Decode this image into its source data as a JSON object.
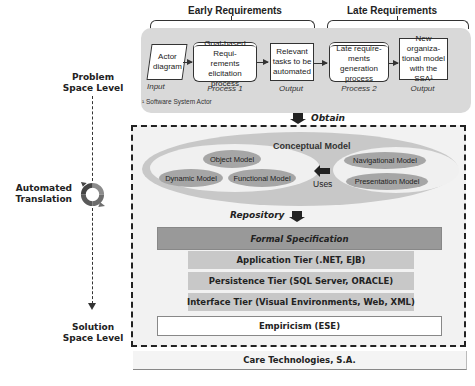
{
  "left_axis": {
    "problem_label": "Problem\nSpace Level",
    "problem_line1": "Problem",
    "problem_line2": "Space Level",
    "translation_line1": "Automated",
    "translation_line2": "Translation",
    "solution_line1": "Solution",
    "solution_line2": "Space Level",
    "cycle_icon": "circular-arrows-icon"
  },
  "requirements": {
    "early_label": "Early Requirements",
    "late_label": "Late Requirements",
    "steps": [
      {
        "text_lines": [
          "Actor",
          "diagram"
        ],
        "caption": "Input",
        "shape": "parallelogram"
      },
      {
        "text_lines": [
          "Goal-based Requi-",
          "rements elicitation",
          "process"
        ],
        "caption": "Process 1",
        "shape": "process"
      },
      {
        "text_lines": [
          "Relevant",
          "tasks to be",
          "automated"
        ],
        "caption": "Output",
        "shape": "document"
      },
      {
        "text_lines": [
          "Late require-",
          "ments generation",
          "process"
        ],
        "caption": "Process 2",
        "shape": "process"
      },
      {
        "text_lines": [
          "New organiza-",
          "tional model",
          "with the SSA¹"
        ],
        "caption": "Output",
        "shape": "document"
      }
    ],
    "footnote": "¹ Software System Actor"
  },
  "obtain_label": "Obtain",
  "conceptual_model": {
    "title": "Conceptual Model",
    "left_models": [
      "Object Model",
      "Dynamic Model",
      "Functional Model"
    ],
    "right_models": [
      "Navigational Model",
      "Presentation Model"
    ],
    "uses_label": "Uses"
  },
  "repository_label": "Repository",
  "tiers": {
    "formal_spec": "Formal Specification",
    "application": "Application Tier (.NET, EJB)",
    "persistence": "Persistence Tier (SQL Server, ORACLE)",
    "interface": "Interface Tier (Visual Environments, Web, XML)",
    "empiricism": "Empiricism (ESE)"
  },
  "footer": "Care Technologies, S.A.",
  "colors": {
    "panel_gray": "#d9d9d9",
    "model_gray": "#a6a6a6",
    "formal_spec": "#999999",
    "tier_gray": "#c8c8c8",
    "dashed_bg": "#f2f2f2"
  }
}
